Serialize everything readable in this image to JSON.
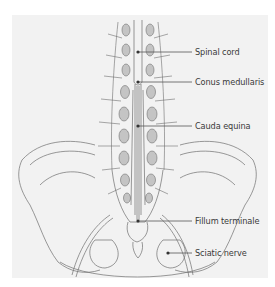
{
  "diagram": {
    "colors": {
      "panel": "#f2f2f2",
      "line": "#6e6e6e",
      "vertebra_fill": "#c4c4c4",
      "leader": "#555555",
      "text": "#3a3a3a"
    },
    "labels": [
      {
        "text": "Spinal cord",
        "y": 52
      },
      {
        "text": "Conus medullaris",
        "y": 82
      },
      {
        "text": "Cauda equina",
        "y": 126
      },
      {
        "text": "Fillum terminale",
        "y": 221
      },
      {
        "text": "Sciatic nerve",
        "y": 253
      }
    ]
  }
}
